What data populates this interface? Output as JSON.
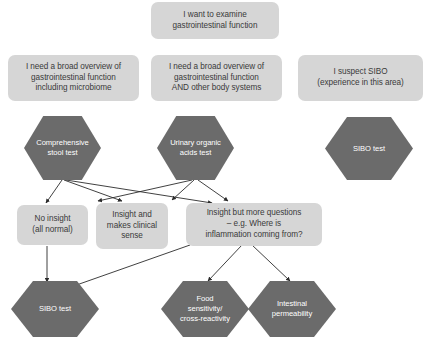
{
  "diagram": {
    "type": "flowchart",
    "background_color": "#ffffff",
    "box_color": "#d6d6d6",
    "box_text_color": "#3a3a3a",
    "hex_color": "#6b6b6b",
    "hex_text_color": "#ffffff",
    "arrow_color": "#2b2b2b"
  },
  "nodes": {
    "root": {
      "label": "I want to examine\ngastrointestinal function",
      "shape": "rounded-box"
    },
    "branch_microbiome": {
      "label": "I need a broad overview of\ngastrointestinal function\nincluding microbiome",
      "shape": "rounded-box"
    },
    "branch_body_systems": {
      "label": "I need a broad overview of\ngastrointestinal function\nAND other body systems",
      "shape": "rounded-box"
    },
    "branch_sibo": {
      "label": "I suspect SIBO\n(experience in this area)",
      "shape": "rounded-box"
    },
    "test_stool": {
      "label": "Comprehensive\nstool test",
      "shape": "hexagon"
    },
    "test_urinary": {
      "label": "Urinary organic\nacids test",
      "shape": "hexagon"
    },
    "test_sibo_top": {
      "label": "SIBO test",
      "shape": "hexagon"
    },
    "outcome_no_insight": {
      "label": "No insight\n(all normal)",
      "shape": "rounded-box"
    },
    "outcome_clinical_sense": {
      "label": "Insight and\nmakes clinical\nsense",
      "shape": "rounded-box"
    },
    "outcome_more_questions": {
      "label": "Insight but more questions\n– e.g. Where is\ninflammation coming from?",
      "shape": "rounded-box"
    },
    "followup_sibo": {
      "label": "SIBO test",
      "shape": "hexagon"
    },
    "followup_food_sensitivity": {
      "label": "Food\nsensitivity/\ncross-reactivity",
      "shape": "hexagon"
    },
    "followup_intestinal_permeability": {
      "label": "Intestinal\npermeability",
      "shape": "hexagon"
    }
  }
}
